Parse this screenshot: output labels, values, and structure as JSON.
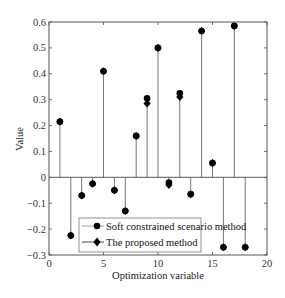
{
  "chart_data": {
    "type": "stem",
    "title": "",
    "xlabel": "Optimization variable",
    "ylabel": "Value",
    "xlim": [
      0,
      20
    ],
    "ylim": [
      -0.3,
      0.6
    ],
    "xticks": [
      0,
      5,
      10,
      15,
      20
    ],
    "xtick_labels": [
      "0",
      "5",
      "10",
      "15",
      "20"
    ],
    "yticks": [
      -0.3,
      -0.2,
      -0.1,
      0,
      0.1,
      0.2,
      0.3,
      0.4,
      0.5,
      0.6
    ],
    "ytick_labels": [
      "−0.3",
      "−0.2",
      "−0.1",
      "0",
      "0.1",
      "0.2",
      "0.3",
      "0.4",
      "0.5",
      "0.6"
    ],
    "grid": false,
    "legend_position": "lower center-left",
    "x": [
      1,
      2,
      3,
      4,
      5,
      6,
      7,
      8,
      9,
      10,
      11,
      12,
      13,
      14,
      15,
      16,
      17,
      18
    ],
    "series": [
      {
        "name": "Soft constrained scenario method",
        "marker": "circle",
        "values": [
          0.215,
          -0.225,
          -0.07,
          -0.025,
          0.41,
          -0.05,
          -0.13,
          0.16,
          0.305,
          0.5,
          -0.02,
          0.325,
          -0.065,
          0.565,
          0.055,
          -0.27,
          0.585,
          -0.27
        ]
      },
      {
        "name": "The proposed method",
        "marker": "diamond",
        "values": [
          0.215,
          -0.225,
          -0.07,
          -0.025,
          0.41,
          -0.05,
          -0.13,
          0.16,
          0.285,
          0.5,
          -0.03,
          0.31,
          -0.065,
          0.565,
          0.055,
          -0.27,
          0.585,
          -0.27
        ]
      }
    ]
  }
}
